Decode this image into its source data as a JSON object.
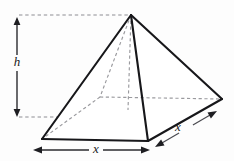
{
  "figure": {
    "type": "geometry-diagram",
    "background_color": "#fdfdfd",
    "solid_edge_color": "#17171a",
    "hidden_edge_color": "#9a9a9e",
    "guide_color": "#8e8e93",
    "dimension_color": "#2a2a2e",
    "label_color": "#1a1a1a"
  },
  "labels": {
    "height": "h",
    "base_width": "x",
    "base_depth": "x"
  },
  "geometry": {
    "apex": {
      "x": 131,
      "y": 15
    },
    "vertex_front_left": {
      "x": 42,
      "y": 139
    },
    "vertex_front_bottom": {
      "x": 148,
      "y": 141
    },
    "vertex_right": {
      "x": 222,
      "y": 99
    },
    "vertex_back_hidden": {
      "x": 100,
      "y": 97
    },
    "base_center": {
      "x": 128,
      "y": 110
    }
  },
  "dimensions": {
    "height_arrow": {
      "axis_x": 17,
      "top_y": 17,
      "bottom_y": 117,
      "label_y": 63
    },
    "width_arrow": {
      "y": 150,
      "left_x": 33,
      "right_x": 150,
      "label_x": 96
    },
    "depth_arrow": {
      "start_x": 155,
      "start_y": 147,
      "end_x": 217,
      "end_y": 111,
      "label_x": 178,
      "label_y": 128
    },
    "guides": {
      "top_guide_y": 15,
      "top_guide_from_x": 19,
      "top_guide_to_x": 131,
      "bottom_guide_y": 117,
      "bottom_guide_from_x": 19,
      "bottom_guide_to_x": 130
    }
  }
}
